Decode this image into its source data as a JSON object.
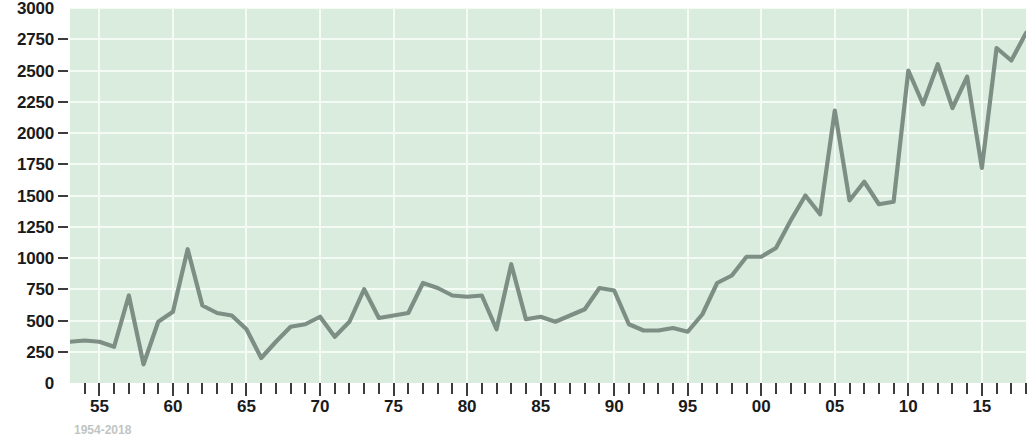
{
  "chart_data": {
    "type": "line",
    "title": "",
    "xlabel": "",
    "ylabel": "",
    "ylim": [
      0,
      3000
    ],
    "ytick_step": 250,
    "ytick_labels": [
      "3000",
      "2750",
      "2500",
      "2250",
      "2000",
      "1750",
      "1500",
      "1250",
      "1000",
      "750",
      "500",
      "250",
      "0"
    ],
    "xlim": [
      1953,
      2018
    ],
    "xtick_labels": [
      "55",
      "60",
      "65",
      "70",
      "75",
      "80",
      "85",
      "90",
      "95",
      "00",
      "05",
      "10",
      "15"
    ],
    "xtick_years": [
      1955,
      1960,
      1965,
      1970,
      1975,
      1980,
      1985,
      1990,
      1995,
      2000,
      2005,
      2010,
      2015
    ],
    "grid": true,
    "legend": null,
    "line_color": "#7d8f85",
    "plot_background": "#d9ecdd",
    "gridline_color": "#f4fbf5",
    "x": [
      1953,
      1954,
      1955,
      1956,
      1957,
      1958,
      1959,
      1960,
      1961,
      1962,
      1963,
      1964,
      1965,
      1966,
      1967,
      1968,
      1969,
      1970,
      1971,
      1972,
      1973,
      1974,
      1975,
      1976,
      1977,
      1978,
      1979,
      1980,
      1981,
      1982,
      1983,
      1984,
      1985,
      1986,
      1987,
      1988,
      1989,
      1990,
      1991,
      1992,
      1993,
      1994,
      1995,
      1996,
      1997,
      1998,
      1999,
      2000,
      2001,
      2002,
      2003,
      2004,
      2005,
      2006,
      2007,
      2008,
      2009,
      2010,
      2011,
      2012,
      2013,
      2014,
      2015,
      2016,
      2017,
      2018
    ],
    "values": [
      330,
      340,
      330,
      290,
      700,
      150,
      490,
      570,
      1070,
      620,
      560,
      540,
      430,
      200,
      330,
      450,
      470,
      530,
      370,
      490,
      750,
      520,
      540,
      560,
      800,
      760,
      700,
      690,
      700,
      430,
      950,
      510,
      530,
      490,
      540,
      590,
      760,
      740,
      470,
      420,
      420,
      440,
      410,
      550,
      800,
      860,
      1010,
      1010,
      1080,
      1300,
      1500,
      1350,
      2180,
      1460,
      1610,
      1430,
      1450,
      2500,
      2230,
      2550,
      2200,
      2450,
      1720,
      2680,
      2580,
      2800
    ]
  },
  "axes": {
    "y_tick_values": [
      3000,
      2750,
      2500,
      2250,
      2000,
      1750,
      1500,
      1250,
      1000,
      750,
      500,
      250,
      0
    ]
  },
  "caption": {
    "text": "1954-2018"
  }
}
